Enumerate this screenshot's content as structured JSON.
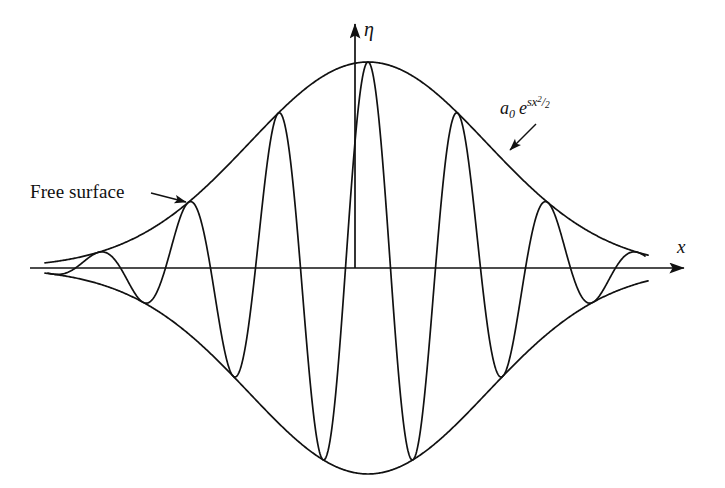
{
  "figure": {
    "title": "",
    "background_color": "#ffffff",
    "stroke_color": "#111111",
    "annotations": {
      "free_surface": "Free surface",
      "envelope_formula_base": "a",
      "envelope_formula_sub": "0",
      "envelope_formula_e": "e",
      "envelope_formula_exp_s": "s",
      "envelope_formula_exp_x": "x",
      "envelope_formula_exp_pow": "2",
      "envelope_formula_exp_slash": "/",
      "envelope_formula_exp_den": "2",
      "envelope_formula_plain": "a0 e^(sx^2/2)"
    },
    "axes": {
      "x_label": "x",
      "y_label": "η",
      "x_axis_y_px": 268,
      "y_axis_x_px": 355,
      "x_axis_start_px": 30,
      "x_axis_end_px": 690,
      "y_axis_top_px": 18,
      "y_axis_bottom_px": 268
    }
  },
  "chart_data": {
    "type": "line",
    "title": "",
    "xlabel": "x",
    "ylabel": "η",
    "grid": false,
    "legend": null,
    "xlim": [
      30,
      690
    ],
    "ylim_px": [
      62,
      456
    ],
    "axis_y_px": 268,
    "center_x_px": 368,
    "envelope": {
      "form": "gaussian",
      "peak_amplitude_px": 206,
      "half_width_px": 168,
      "upper_start_x_px": 45,
      "upper_end_x_px": 648,
      "lower_start_x_px": 46,
      "lower_end_x_px": 650,
      "upper_peak_y_px": 62,
      "lower_trough_y_px": 456,
      "edge_amplitude_px": 28
    },
    "oscillation": {
      "half_period_px": 45,
      "zero_crossings_px": [
        48,
        82,
        128,
        172,
        218,
        262,
        308,
        352,
        388,
        432,
        478,
        522,
        568,
        612,
        645
      ],
      "n_half_cycles": 15,
      "phase": "crest at center, adjacent to eta axis"
    },
    "series": [
      {
        "name": "upper envelope",
        "role": "envelope-upper"
      },
      {
        "name": "lower envelope",
        "role": "envelope-lower"
      },
      {
        "name": "free surface elevation",
        "role": "oscillation"
      }
    ],
    "leaders": [
      {
        "name": "free-surface-leader",
        "from_px": [
          151,
          193
        ],
        "to_px": [
          189,
          203
        ]
      },
      {
        "name": "envelope-formula-leader",
        "from_px": [
          536,
          124
        ],
        "to_px": [
          507,
          153
        ]
      }
    ]
  }
}
